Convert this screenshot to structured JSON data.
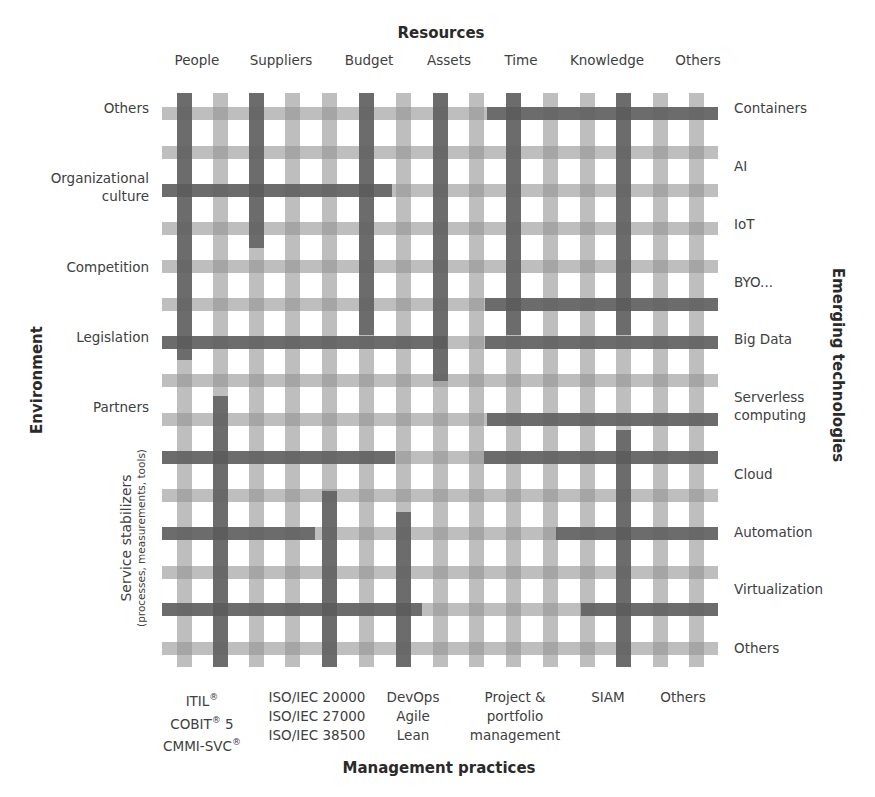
{
  "titles": {
    "top": "Resources",
    "bottom": "Management practices",
    "left": "Environment",
    "right": "Emerging technologies",
    "left_lower": "Service stabilizers",
    "left_lower_sub": "(processes, measurements, tools)"
  },
  "resources": [
    "People",
    "Suppliers",
    "Budget",
    "Assets",
    "Time",
    "Knowledge",
    "Others"
  ],
  "environment": [
    "Others",
    "Organizational",
    "culture",
    "Competition",
    "Legislation",
    "Partners"
  ],
  "emerging_technologies": [
    "Containers",
    "AI",
    "IoT",
    "BYO...",
    "Big Data",
    "Serverless",
    "computing",
    "Cloud",
    "Automation",
    "Virtualization",
    "Others"
  ],
  "management_practices": {
    "itil": {
      "l1": "ITIL",
      "l2": "COBIT",
      "l2b": " 5",
      "l3": "CMMI-SVC",
      "reg": "®"
    },
    "iso": {
      "l1": "ISO/IEC 20000",
      "l2": "ISO/IEC 27000",
      "l3": "ISO/IEC 38500"
    },
    "devops": {
      "l1": "DevOps",
      "l2": "Agile",
      "l3": "Lean"
    },
    "project": {
      "l1": "Project &",
      "l2": "portfolio",
      "l3": "management"
    },
    "siam": {
      "l1": "SIAM"
    },
    "others": {
      "l1": "Others"
    }
  },
  "colors": {
    "light_bar": "#bdbdbd",
    "dark_bar": "#6e6e6e",
    "background": "#ffffff"
  }
}
